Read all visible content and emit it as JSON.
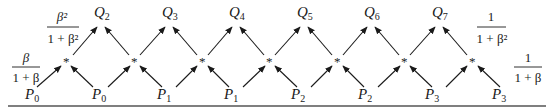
{
  "diagram": {
    "type": "butterfly-lattice",
    "star_symbol": "*",
    "top_nodes": [
      {
        "label": "Q",
        "sub": "2"
      },
      {
        "label": "Q",
        "sub": "3"
      },
      {
        "label": "Q",
        "sub": "4"
      },
      {
        "label": "Q",
        "sub": "5"
      },
      {
        "label": "Q",
        "sub": "6"
      },
      {
        "label": "Q",
        "sub": "7"
      }
    ],
    "bottom_nodes": [
      {
        "label": "P",
        "sub": "0"
      },
      {
        "label": "P",
        "sub": "0"
      },
      {
        "label": "P",
        "sub": "1"
      },
      {
        "label": "P",
        "sub": "1"
      },
      {
        "label": "P",
        "sub": "2"
      },
      {
        "label": "P",
        "sub": "2"
      },
      {
        "label": "P",
        "sub": "3"
      },
      {
        "label": "P",
        "sub": "3"
      }
    ],
    "weights": {
      "left_lower": {
        "num": "β",
        "den": "1 + β"
      },
      "left_upper": {
        "num": "β²",
        "den": "1 + β²"
      },
      "right_upper": {
        "num": "1",
        "den": "1 + β²"
      },
      "right_lower": {
        "num": "1",
        "den": "1 + β"
      }
    },
    "colors": {
      "ink": "#1a1a1a",
      "rule": "#555555"
    }
  }
}
